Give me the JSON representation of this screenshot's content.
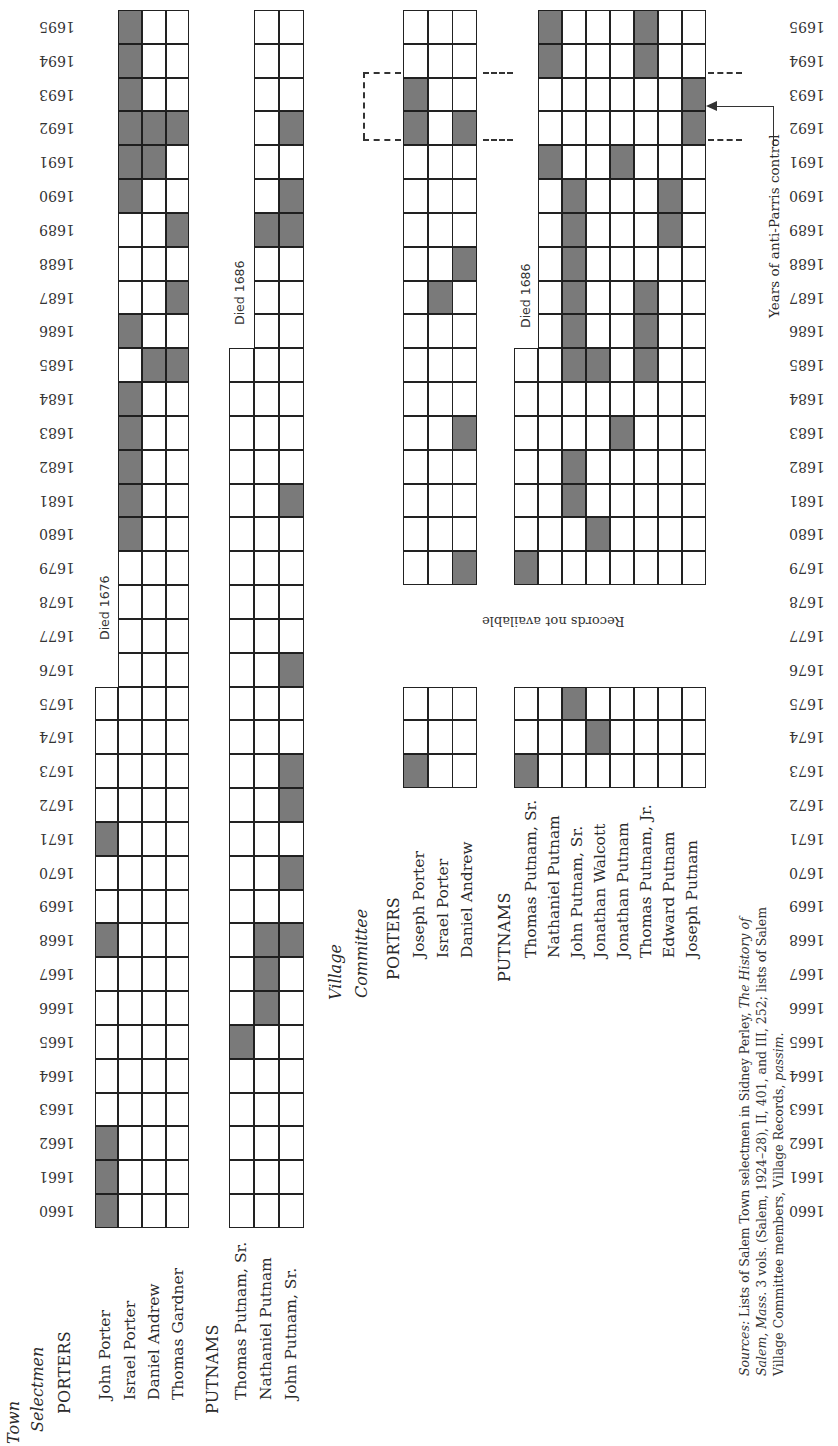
{
  "chart_data": {
    "type": "table",
    "orientation_note": "Figure printed rotated 90°; years run along the long axis",
    "years": [
      1660,
      1661,
      1662,
      1663,
      1664,
      1665,
      1666,
      1667,
      1668,
      1669,
      1670,
      1671,
      1672,
      1673,
      1674,
      1675,
      1676,
      1677,
      1678,
      1679,
      1680,
      1681,
      1682,
      1683,
      1684,
      1685,
      1686,
      1687,
      1688,
      1689,
      1690,
      1691,
      1692,
      1693,
      1694,
      1695
    ],
    "legend": {
      "shaded": "served that year",
      "unshaded": "did not serve"
    },
    "town_selectmen": {
      "title_line1": "Town",
      "title_line2": "Selectmen",
      "porters": {
        "label": "PORTERS",
        "members": [
          {
            "name": "John Porter",
            "active_range": [
              1660,
              1675
            ],
            "note": "Died 1676",
            "served": [
              1660,
              1661,
              1662,
              1668,
              1671
            ]
          },
          {
            "name": "Israel Porter",
            "active_range": [
              1660,
              1695
            ],
            "served": [
              1680,
              1681,
              1682,
              1683,
              1684,
              1686,
              1690,
              1691,
              1692,
              1693,
              1694,
              1695
            ]
          },
          {
            "name": "Daniel Andrew",
            "active_range": [
              1660,
              1695
            ],
            "served": [
              1685,
              1691,
              1692
            ]
          },
          {
            "name": "Thomas Gardner",
            "active_range": [
              1660,
              1695
            ],
            "served": [
              1685,
              1687,
              1689,
              1692
            ]
          }
        ]
      },
      "putnams": {
        "label": "PUTNAMS",
        "members": [
          {
            "name": "Thomas Putnam, Sr.",
            "active_range": [
              1660,
              1685
            ],
            "note": "Died 1686",
            "served": [
              1665
            ]
          },
          {
            "name": "Nathaniel Putnam",
            "active_range": [
              1660,
              1695
            ],
            "served": [
              1666,
              1667,
              1668,
              1689
            ]
          },
          {
            "name": "John Putnam, Sr.",
            "active_range": [
              1660,
              1695
            ],
            "served": [
              1668,
              1670,
              1672,
              1673,
              1676,
              1681,
              1689,
              1690,
              1692
            ]
          }
        ]
      }
    },
    "village_committee": {
      "title_line1": "Village",
      "title_line2": "Committee",
      "records_gap": {
        "years": [
          1676,
          1678
        ],
        "text": "Records not available"
      },
      "porters": {
        "label": "PORTERS",
        "members": [
          {
            "name": "Joseph Porter",
            "served": [
              1673,
              1692,
              1693
            ]
          },
          {
            "name": "Israel Porter",
            "served": [
              1687
            ]
          },
          {
            "name": "Daniel Andrew",
            "served": [
              1679,
              1683,
              1688,
              1692
            ]
          }
        ]
      },
      "putnams": {
        "label": "PUTNAMS",
        "members": [
          {
            "name": "Thomas Putnam, Sr.",
            "active_range": [
              1673,
              1685
            ],
            "note": "Died 1686",
            "served": [
              1673,
              1679
            ]
          },
          {
            "name": "Nathaniel Putnam",
            "served": [
              1691,
              1694,
              1695
            ]
          },
          {
            "name": "John Putnam, Sr.",
            "served": [
              1675,
              1681,
              1682,
              1685,
              1686,
              1687,
              1688,
              1689,
              1690
            ]
          },
          {
            "name": "Jonathan Walcott",
            "served": [
              1674,
              1680,
              1685
            ]
          },
          {
            "name": "Jonathan Putnam",
            "served": [
              1683,
              1691
            ]
          },
          {
            "name": "Thomas Putnam, Jr.",
            "served": [
              1685,
              1686,
              1687,
              1694,
              1695
            ]
          },
          {
            "name": "Edward Putnam",
            "served": [
              1689,
              1690
            ]
          },
          {
            "name": "Joseph Putnam",
            "served": [
              1692,
              1693
            ]
          }
        ]
      }
    },
    "annotation": {
      "text": "Years of anti-Parris control",
      "years": [
        1692,
        1693
      ]
    }
  },
  "labels": {
    "died_1676": "Died 1676",
    "died_1686_town": "Died 1686",
    "died_1686_village": "Died 1686",
    "records_not_available": "Records not available",
    "anti_parris": "Years of anti-Parris control"
  },
  "sources": {
    "prefix": "Sources:",
    "line1_a": " Lists of Salem Town selectmen in Sidney Perley, ",
    "line1_b": "The History of",
    "line2_a": "Salem, Mass.",
    "line2_b": " 3 vols. (Salem, 1924–28), II, 401, and III, 252; lists of Salem",
    "line3_a": "Village Committee members, Village Records, ",
    "line3_b": "passim."
  },
  "colors": {
    "shaded_cell": "#7a7a7a",
    "grid_line": "#222222",
    "paper": "#ffffff"
  }
}
